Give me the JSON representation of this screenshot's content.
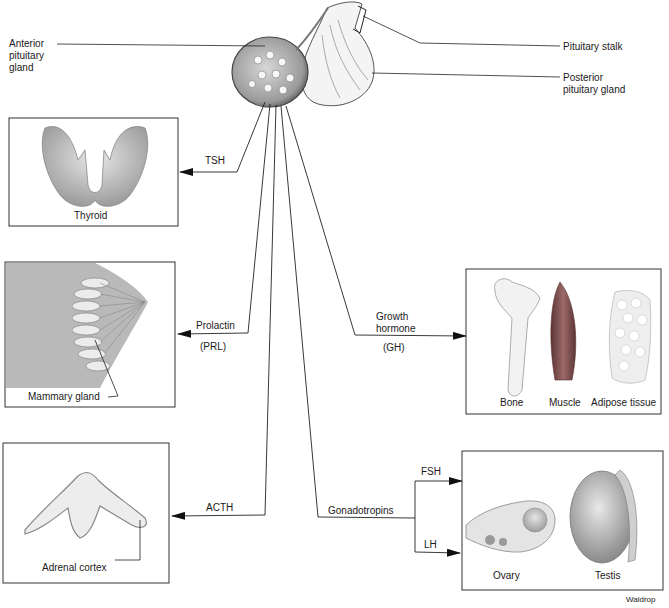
{
  "pituitary": {
    "anterior_label": "Anterior pituitary gland",
    "anterior_lines": [
      "Anterior",
      "pituitary",
      "gland"
    ],
    "stalk_label": "Pituitary stalk",
    "posterior_lines": [
      "Posterior",
      "pituitary gland"
    ]
  },
  "targets": {
    "thyroid": {
      "hormone": "TSH",
      "caption": "Thyroid"
    },
    "mammary": {
      "hormone": "Prolactin",
      "hormone_abbr": "(PRL)",
      "caption": "Mammary gland"
    },
    "growth": {
      "hormone_lines": [
        "Growth",
        "hormone"
      ],
      "hormone_abbr": "(GH)",
      "captions": [
        "Bone",
        "Muscle",
        "Adipose tissue"
      ]
    },
    "adrenal": {
      "hormone": "ACTH",
      "caption": "Adrenal cortex"
    },
    "gonads": {
      "hormone": "Gonadotropins",
      "branches": [
        "FSH",
        "LH"
      ],
      "captions": [
        "Ovary",
        "Testis"
      ]
    }
  },
  "credit": "Waldrop",
  "colors": {
    "line": "#222222",
    "tissue": "#bdbdbd",
    "muscle": "#7a4a4a",
    "gland_shadow": "#8c8c8c"
  }
}
